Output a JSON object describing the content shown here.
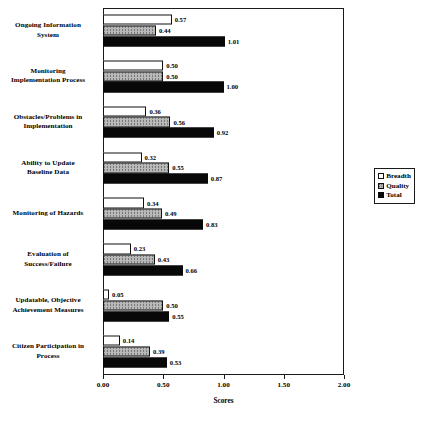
{
  "chart_data": {
    "type": "bar",
    "orientation": "horizontal",
    "title": "",
    "xlabel": "Scores",
    "ylabel": "",
    "xlim": [
      0.0,
      2.0
    ],
    "xticks": [
      "0.00",
      "0.50",
      "1.00",
      "1.50",
      "2.00"
    ],
    "xtick_values": [
      0.0,
      0.5,
      1.0,
      1.5,
      2.0
    ],
    "grid": false,
    "legend_position": "right-middle",
    "categories": [
      "Ongoing Information System",
      "Monitoring Implementation Process",
      "Obstacles/Problems in Implementation",
      "Ability to Update Baseline Data",
      "Monitoring of Hazards",
      "Evaluation of Success/Failure",
      "Updatable, Objective Achievement Measures",
      "Citizen Participation in Process"
    ],
    "category_lines": [
      [
        "Ongoing Information",
        "System"
      ],
      [
        "Monitoring",
        "Implementation Process"
      ],
      [
        "Obstacles/Problems in",
        "Implementation"
      ],
      [
        "Ability to Update",
        "Baseline Data"
      ],
      [
        "Monitoring of Hazards"
      ],
      [
        "Evaluation of",
        "Success/Failure"
      ],
      [
        "Updatable, Objective",
        "Achievement Measures"
      ],
      [
        "Citizen Participation in",
        "Process"
      ]
    ],
    "series": [
      {
        "name": "Breadth",
        "fill": "white",
        "values": [
          0.57,
          0.5,
          0.36,
          0.32,
          0.34,
          0.23,
          0.05,
          0.14
        ],
        "labels": [
          "0.57",
          "0.50",
          "0.36",
          "0.32",
          "0.34",
          "0.23",
          "0.05",
          "0.14"
        ]
      },
      {
        "name": "Quality",
        "fill": "gray-stipple",
        "values": [
          0.44,
          0.5,
          0.56,
          0.55,
          0.49,
          0.43,
          0.5,
          0.39
        ],
        "labels": [
          "0.44",
          "0.50",
          "0.56",
          "0.55",
          "0.49",
          "0.43",
          "0.50",
          "0.39"
        ]
      },
      {
        "name": "Total",
        "fill": "black",
        "values": [
          1.01,
          1.0,
          0.92,
          0.87,
          0.83,
          0.66,
          0.55,
          0.53
        ],
        "labels": [
          "1.01",
          "1.00",
          "0.92",
          "0.87",
          "0.83",
          "0.66",
          "0.55",
          "0.53"
        ]
      }
    ]
  },
  "legend": {
    "items": [
      {
        "label": "Breadth",
        "swatch": "white-square"
      },
      {
        "label": "Quality",
        "swatch": "gray-stipple-square"
      },
      {
        "label": "Total",
        "swatch": "black-square"
      }
    ]
  },
  "colors": {
    "breadth": "#ffffff",
    "quality": "#b8b8b8",
    "total": "#080808",
    "axis": "#1a1a1a",
    "background": "#ffffff"
  }
}
